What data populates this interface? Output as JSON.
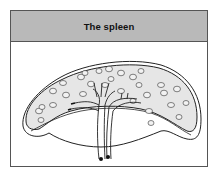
{
  "figure": {
    "title": "The spleen",
    "colors": {
      "header_bg": "#b9b9b9",
      "border": "#555555",
      "organ_fill": "#e6e6e6",
      "outline": "#222222",
      "background": "#ffffff"
    },
    "labels": []
  }
}
